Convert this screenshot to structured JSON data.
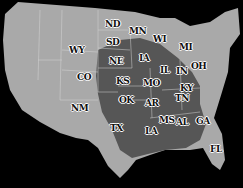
{
  "map": {
    "title": "",
    "region": "Contiguous United States",
    "colors": {
      "background": "#000000",
      "land": "#a9a9a9",
      "highlight_region": "#565656",
      "borders": "#d8d8d8"
    },
    "labels": [
      {
        "id": "ND",
        "text": "ND",
        "x": 105,
        "y": 24
      },
      {
        "id": "MN",
        "text": "MN",
        "x": 129,
        "y": 31
      },
      {
        "id": "SD",
        "text": "SD",
        "x": 106,
        "y": 42
      },
      {
        "id": "WI",
        "text": "WI",
        "x": 153,
        "y": 39
      },
      {
        "id": "MI",
        "text": "MI",
        "x": 179,
        "y": 47
      },
      {
        "id": "WY",
        "text": "WY",
        "x": 69,
        "y": 50
      },
      {
        "id": "NE",
        "text": "NE",
        "x": 109,
        "y": 61
      },
      {
        "id": "IA",
        "text": "IA",
        "x": 139,
        "y": 58
      },
      {
        "id": "CO",
        "text": "CO",
        "x": 77,
        "y": 77
      },
      {
        "id": "KS",
        "text": "KS",
        "x": 116,
        "y": 81
      },
      {
        "id": "IL",
        "text": "IL",
        "x": 160,
        "y": 70
      },
      {
        "id": "IN",
        "text": "IN",
        "x": 176,
        "y": 71
      },
      {
        "id": "OH",
        "text": "OH",
        "x": 191,
        "y": 66
      },
      {
        "id": "MO",
        "text": "MO",
        "x": 143,
        "y": 83
      },
      {
        "id": "KY",
        "text": "KY",
        "x": 180,
        "y": 88
      },
      {
        "id": "TN",
        "text": "TN",
        "x": 175,
        "y": 98
      },
      {
        "id": "OK",
        "text": "OK",
        "x": 119,
        "y": 100
      },
      {
        "id": "AR",
        "text": "AR",
        "x": 145,
        "y": 103
      },
      {
        "id": "NM",
        "text": "NM",
        "x": 71,
        "y": 108
      },
      {
        "id": "MS",
        "text": "MS",
        "x": 159,
        "y": 120
      },
      {
        "id": "AL",
        "text": "AL",
        "x": 176,
        "y": 122
      },
      {
        "id": "GA",
        "text": "GA",
        "x": 196,
        "y": 121
      },
      {
        "id": "TX",
        "text": "TX",
        "x": 110,
        "y": 128
      },
      {
        "id": "LA",
        "text": "LA",
        "x": 145,
        "y": 131
      },
      {
        "id": "FL",
        "text": "FL",
        "x": 210,
        "y": 149
      }
    ]
  }
}
